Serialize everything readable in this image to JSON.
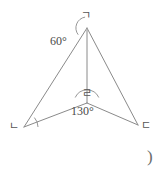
{
  "figure": {
    "background_color": "#ffffff",
    "stroke_color": "#8a8a8a",
    "text_color": "#4a4a4a",
    "canvas": {
      "width": 168,
      "height": 174
    },
    "vertices": [
      {
        "id": "a",
        "name": "apex-vertex",
        "label": "ㄱ",
        "x": 87,
        "y": 28,
        "label_x": 81,
        "label_y": 10
      },
      {
        "id": "b",
        "name": "bottom-left-vertex",
        "label": "ㄴ",
        "x": 24,
        "y": 127,
        "label_x": 9,
        "label_y": 121
      },
      {
        "id": "c",
        "name": "bottom-right-vertex",
        "label": "ㄷ",
        "x": 138,
        "y": 125,
        "label_x": 141,
        "label_y": 120
      },
      {
        "id": "d",
        "name": "interior-vertex",
        "label": "ㄹ",
        "x": 87,
        "y": 103,
        "label_x": 82,
        "label_y": 88
      }
    ],
    "segments": [
      {
        "name": "segment-a-b",
        "from": "a",
        "to": "b"
      },
      {
        "name": "segment-a-c",
        "from": "a",
        "to": "c"
      },
      {
        "name": "segment-a-d",
        "from": "a",
        "to": "d"
      },
      {
        "name": "segment-b-d",
        "from": "b",
        "to": "d"
      },
      {
        "name": "segment-c-d",
        "from": "c",
        "to": "d"
      }
    ],
    "angles": [
      {
        "id": "apex",
        "name": "angle-at-apex",
        "label": "60°",
        "value": 60,
        "unit": "degrees",
        "at_vertex": "a",
        "label_x": 50,
        "label_y": 35,
        "arc": {
          "cx": 87,
          "cy": 28,
          "r": 11,
          "start_deg": 100,
          "end_deg": 143
        }
      },
      {
        "id": "center",
        "name": "angle-at-interior-vertex",
        "label": "130°",
        "value": 130,
        "unit": "degrees",
        "at_vertex": "d",
        "label_x": 71,
        "label_y": 105,
        "arc": {
          "cx": 87,
          "cy": 103,
          "r": 13,
          "start_deg": 25,
          "end_deg": 155
        }
      },
      {
        "id": "bottom-left",
        "name": "angle-mark-at-bottom-left-vertex",
        "label": "",
        "value": null,
        "unit": "degrees",
        "at_vertex": "b",
        "arc": {
          "cx": 24,
          "cy": 127,
          "r": 14,
          "start_deg": 0,
          "end_deg": 42
        }
      }
    ],
    "annotations": [
      {
        "name": "stray-parenthesis-mark",
        "text": ")",
        "x": 147,
        "y": 148
      }
    ]
  }
}
